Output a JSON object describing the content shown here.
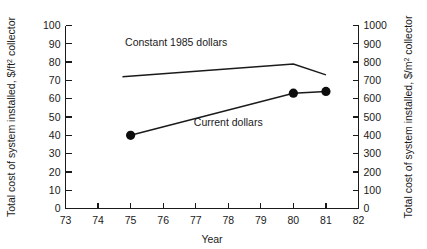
{
  "chart_data": {
    "type": "line",
    "title": "",
    "xlabel": "Year",
    "ylabel": "Total cost of system installed, $/ft2 collector",
    "ylabel_main": "Total cost of system installed, $/ft",
    "ylabel_main_sup": "2",
    "ylabel_main_tail": " collector",
    "y2label_main": "Total cost of system installed, $/m",
    "y2label_main_sup": "2",
    "y2label_main_tail": " collector",
    "y2label": "Total cost of system installed, $/m2 collector",
    "xlim": [
      73,
      82
    ],
    "ylim": [
      0,
      100
    ],
    "y2lim": [
      0,
      1000
    ],
    "grid": false,
    "legend_position": "inline-annotations",
    "xticks": [
      "73",
      "74",
      "75",
      "76",
      "77",
      "78",
      "79",
      "80",
      "81",
      "82"
    ],
    "xtick_values": [
      73,
      74,
      75,
      76,
      77,
      78,
      79,
      80,
      81,
      82
    ],
    "yticks": [
      "0",
      "10",
      "20",
      "30",
      "40",
      "50",
      "60",
      "70",
      "80",
      "90",
      "100"
    ],
    "ytick_values": [
      0,
      10,
      20,
      30,
      40,
      50,
      60,
      70,
      80,
      90,
      100
    ],
    "y2ticks": [
      "0",
      "100",
      "200",
      "300",
      "400",
      "500",
      "600",
      "700",
      "800",
      "900",
      "1000"
    ],
    "y2tick_values": [
      0,
      100,
      200,
      300,
      400,
      500,
      600,
      700,
      800,
      900,
      1000
    ],
    "annotations": [
      {
        "text": "Constant 1985 dollars",
        "x": 76.4,
        "y": 89
      },
      {
        "text": "Current dollars",
        "x": 78.0,
        "y": 45
      }
    ],
    "series": [
      {
        "name": "Constant 1985 dollars",
        "markers": false,
        "x": [
          74.75,
          80.0,
          81.0
        ],
        "values": [
          72,
          79,
          73
        ]
      },
      {
        "name": "Current dollars",
        "markers": true,
        "x": [
          75.0,
          80.0,
          81.0
        ],
        "values": [
          40,
          63,
          64
        ]
      }
    ]
  }
}
